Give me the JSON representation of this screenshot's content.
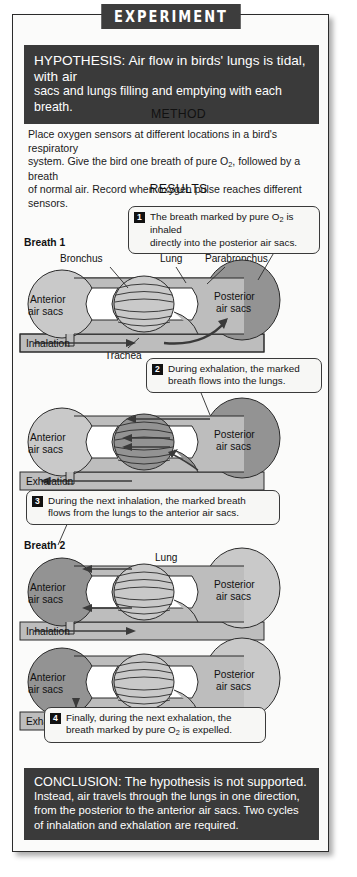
{
  "title": "EXPERIMENT",
  "hypothesis": {
    "lead": "HYPOTHESIS:",
    "lines": [
      "HYPOTHESIS: Air flow in birds' lungs is tidal, with air",
      "sacs and lungs filling and emptying with each breath."
    ]
  },
  "method": {
    "heading": "METHOD",
    "lines": [
      "Place oxygen sensors at different locations in a bird's respiratory",
      "system. Give the bird one breath of pure O2, followed by a breath",
      "of normal air. Record when oxygen pulse reaches different sensors."
    ]
  },
  "results": {
    "heading": "RESULTS",
    "breath1_label": "Breath 1",
    "breath2_label": "Breath 2",
    "callouts": [
      {
        "number": "1",
        "lines": [
          "The breath marked by pure O2 is inhaled",
          "directly into the posterior air sacs."
        ]
      },
      {
        "number": "2",
        "lines": [
          "During exhalation, the marked",
          "breath flows into the lungs."
        ]
      },
      {
        "number": "3",
        "lines": [
          "During the next inhalation, the marked breath",
          "flows from the lungs to the anterior air sacs."
        ]
      },
      {
        "number": "4",
        "lines": [
          "Finally, during the next exhalation, the",
          "breath marked by pure O2 is expelled."
        ]
      }
    ],
    "anatomy_labels": {
      "bronchus": "Bronchus",
      "lung": "Lung",
      "parabronchus": "Parabronchus",
      "trachea": "Trachea",
      "anterior": "Anterior",
      "anterior2": "air sacs",
      "posterior": "Posterior",
      "posterior2": "air sacs",
      "inhalation": "Inhalation",
      "exhalation": "Exhalation"
    }
  },
  "conclusion": {
    "lead": "CONCLUSION:",
    "lines": [
      "CONCLUSION: The hypothesis is not supported.",
      "Instead, air travels through the lungs in one direction,",
      "from the posterior to the anterior air sacs. Two cycles",
      "of inhalation and exhalation are required."
    ]
  },
  "colors": {
    "dark_bar": "#3a3a3a",
    "marked_sac": "#939393",
    "unmarked_sac": "#c9c9c9",
    "airway": "#bdbdbd",
    "panel_bg": "#fbfbfa"
  }
}
